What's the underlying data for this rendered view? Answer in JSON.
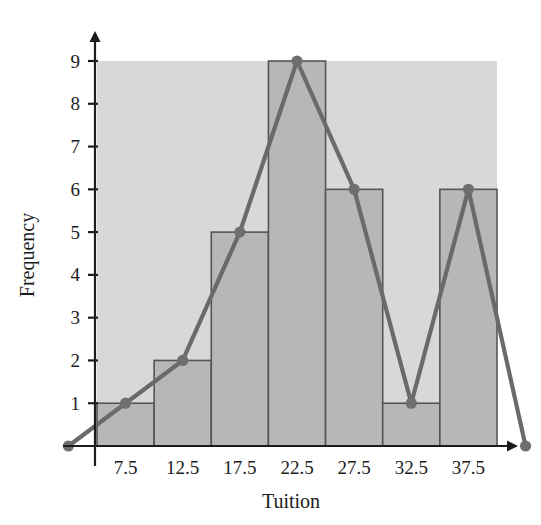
{
  "chart_data": {
    "type": "bar",
    "title": "",
    "subtitle": "",
    "xlabel": "Tuition",
    "ylabel": "Frequency",
    "categories": [
      "7.5",
      "12.5",
      "17.5",
      "22.5",
      "27.5",
      "32.5",
      "37.5"
    ],
    "values": [
      1,
      2,
      5,
      9,
      6,
      1,
      6
    ],
    "x_tick_labels": [
      "7.5",
      "12.5",
      "17.5",
      "22.5",
      "27.5",
      "32.5",
      "37.5"
    ],
    "y_tick_labels": [
      "1",
      "2",
      "3",
      "4",
      "5",
      "6",
      "7",
      "8",
      "9"
    ],
    "y_tick_values": [
      1,
      2,
      3,
      4,
      5,
      6,
      7,
      8,
      9
    ],
    "ylim": [
      0,
      9
    ],
    "xlim": [
      2.5,
      42.5
    ],
    "bin_edges": [
      5,
      10,
      15,
      20,
      25,
      30,
      35,
      40
    ],
    "grid": false,
    "legend": null,
    "legend_position": "none",
    "overlay": {
      "type": "line",
      "name": "frequency-polygon",
      "x": [
        2.5,
        7.5,
        12.5,
        17.5,
        22.5,
        27.5,
        32.5,
        37.5,
        42.5
      ],
      "values": [
        0,
        1,
        2,
        5,
        9,
        6,
        1,
        6,
        0
      ],
      "marker": "circle"
    },
    "colors": {
      "plot_background": "#d8d8d8",
      "bar_fill": "#b7b7b7",
      "bar_edge": "#555555",
      "line": "#6a6a6a",
      "marker": "#6f6f6f",
      "axis": "#1c1c1c",
      "text": "#1c1c1c",
      "page_background": "#ffffff"
    }
  },
  "axes": {
    "x_axis_name": "tuition-axis",
    "y_axis_name": "frequency-axis",
    "x_arrow": true,
    "y_arrow": true
  }
}
